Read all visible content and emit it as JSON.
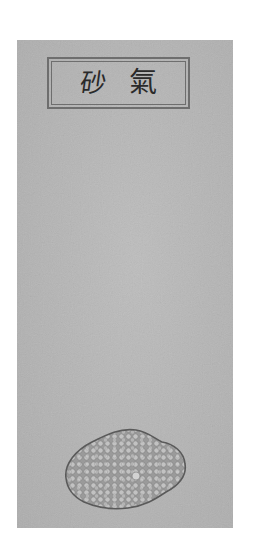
{
  "image": {
    "description": "Illustrated plate of a mineral specimen with a title label",
    "background_color": "#ffffff",
    "page_color": "#b4b4b4"
  },
  "label": {
    "characters": [
      "砂",
      "氣"
    ],
    "text": "砂 氣",
    "border_color": "#6e6e6e",
    "text_color": "#2a2a2a"
  },
  "specimen": {
    "name": "granular stone",
    "outline_color": "#5a5a5a",
    "fill_color": "#a8a8a8",
    "cell_color": "#c4c4c4"
  }
}
